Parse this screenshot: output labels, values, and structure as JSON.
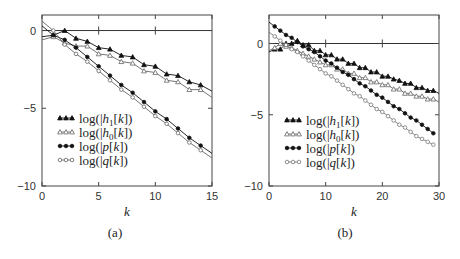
{
  "chart_data": [
    {
      "type": "line",
      "panel_label": "(a)",
      "title": "",
      "xlabel": "k",
      "ylabel": "",
      "xlim": [
        0,
        15
      ],
      "ylim": [
        -10,
        1
      ],
      "xticks": [
        0,
        5,
        10,
        15
      ],
      "yticks": [
        0,
        -5,
        -10
      ],
      "grid": false,
      "zero_line": true,
      "legend_position": "lower-left inside",
      "series": [
        {
          "name": "log(|h1[k])",
          "marker": "filled-triangle",
          "color": "#111111",
          "x": [
            0,
            1,
            2,
            3,
            4,
            5,
            6,
            7,
            8,
            9,
            10,
            11,
            12,
            13,
            14,
            15
          ],
          "y": [
            -0.4,
            -0.3,
            0.0,
            -0.5,
            -0.7,
            -1.1,
            -1.2,
            -1.6,
            -1.7,
            -2.2,
            -2.3,
            -2.8,
            -2.9,
            -3.3,
            -3.5,
            -3.9
          ]
        },
        {
          "name": "log(|h0[k])",
          "marker": "open-triangle",
          "color": "#666666",
          "x": [
            0,
            1,
            2,
            3,
            4,
            5,
            6,
            7,
            8,
            9,
            10,
            11,
            12,
            13,
            14,
            15
          ],
          "y": [
            -0.6,
            -0.4,
            -0.8,
            -1.0,
            -1.0,
            -1.5,
            -1.6,
            -2.0,
            -2.1,
            -2.6,
            -2.7,
            -3.2,
            -3.3,
            -3.8,
            -3.8,
            -4.3
          ]
        },
        {
          "name": "log(|p[k])",
          "marker": "filled-circle",
          "color": "#111111",
          "x": [
            0,
            1,
            2,
            3,
            4,
            5,
            6,
            7,
            8,
            9,
            10,
            11,
            12,
            13,
            14,
            15
          ],
          "y": [
            0.3,
            -0.3,
            -0.6,
            -1.1,
            -1.7,
            -2.3,
            -2.9,
            -3.5,
            -4.0,
            -4.6,
            -5.2,
            -5.7,
            -6.3,
            -6.9,
            -7.4,
            -7.9
          ]
        },
        {
          "name": "log(|q[k])",
          "marker": "open-circle",
          "color": "#666666",
          "x": [
            0,
            1,
            2,
            3,
            4,
            5,
            6,
            7,
            8,
            9,
            10,
            11,
            12,
            13,
            14,
            15
          ],
          "y": [
            0.6,
            0.0,
            -0.9,
            -1.5,
            -2.0,
            -2.6,
            -3.2,
            -3.8,
            -4.3,
            -4.9,
            -5.5,
            -6.0,
            -6.6,
            -7.2,
            -7.7,
            -8.2
          ]
        }
      ]
    },
    {
      "type": "line",
      "panel_label": "(b)",
      "title": "",
      "xlabel": "k",
      "ylabel": "",
      "xlim": [
        0,
        30
      ],
      "ylim": [
        -10,
        2
      ],
      "xticks": [
        0,
        10,
        20,
        30
      ],
      "yticks": [
        0,
        -5,
        -10
      ],
      "grid": false,
      "zero_line": true,
      "legend_position": "lower-left inside",
      "series": [
        {
          "name": "log(|h1[k])",
          "marker": "filled-triangle",
          "color": "#111111",
          "x": [
            0,
            1,
            2,
            3,
            4,
            5,
            6,
            7,
            8,
            9,
            10,
            11,
            12,
            13,
            14,
            15,
            16,
            17,
            18,
            19,
            20,
            21,
            22,
            23,
            24,
            25,
            26,
            27,
            28,
            29,
            30
          ],
          "y": [
            -0.6,
            -0.4,
            -0.4,
            0.0,
            0.0,
            0.2,
            -0.1,
            -0.1,
            -0.5,
            -0.5,
            -0.8,
            -0.8,
            -1.1,
            -1.1,
            -1.4,
            -1.4,
            -1.7,
            -1.7,
            -2.0,
            -2.0,
            -2.3,
            -2.3,
            -2.5,
            -2.6,
            -2.8,
            -2.8,
            -3.1,
            -3.1,
            -3.3,
            -3.3,
            -3.5
          ]
        },
        {
          "name": "log(|h0[k])",
          "marker": "open-triangle",
          "color": "#666666",
          "x": [
            0,
            1,
            2,
            3,
            4,
            5,
            6,
            7,
            8,
            9,
            10,
            11,
            12,
            13,
            14,
            15,
            16,
            17,
            18,
            19,
            20,
            21,
            22,
            23,
            24,
            25,
            26,
            27,
            28,
            29,
            30
          ],
          "y": [
            -0.5,
            -0.3,
            0.0,
            -0.2,
            -0.3,
            -0.5,
            -0.7,
            -0.9,
            -1.1,
            -1.3,
            -1.5,
            -1.5,
            -1.8,
            -1.8,
            -2.1,
            -2.1,
            -2.4,
            -2.4,
            -2.7,
            -2.7,
            -2.9,
            -2.9,
            -3.2,
            -3.2,
            -3.5,
            -3.5,
            -3.7,
            -3.7,
            -3.9,
            -3.9,
            -4.1
          ]
        },
        {
          "name": "log(|p[k])",
          "marker": "filled-circle",
          "color": "#111111",
          "x": [
            0,
            1,
            2,
            3,
            4,
            5,
            6,
            7,
            8,
            9,
            10,
            11,
            12,
            13,
            14,
            15,
            16,
            17,
            18,
            19,
            20,
            21,
            22,
            23,
            24,
            25,
            26,
            27,
            28,
            29
          ],
          "y": [
            1.5,
            1.2,
            0.9,
            0.6,
            0.4,
            0.1,
            -0.2,
            -0.4,
            -0.6,
            -0.9,
            -1.2,
            -1.4,
            -1.7,
            -2.0,
            -2.2,
            -2.5,
            -2.8,
            -3.0,
            -3.3,
            -3.6,
            -3.8,
            -4.1,
            -4.4,
            -4.6,
            -4.9,
            -5.2,
            -5.4,
            -5.7,
            -6.0,
            -6.3
          ]
        },
        {
          "name": "log(|q[k])",
          "marker": "open-circle",
          "color": "#777777",
          "x": [
            0,
            1,
            2,
            3,
            4,
            5,
            6,
            7,
            8,
            9,
            10,
            11,
            12,
            13,
            14,
            15,
            16,
            17,
            18,
            19,
            20,
            21,
            22,
            23,
            24,
            25,
            26,
            27,
            28,
            29
          ],
          "y": [
            0.8,
            0.5,
            0.2,
            -0.1,
            -0.4,
            -0.6,
            -0.9,
            -1.2,
            -1.5,
            -1.8,
            -2.1,
            -2.3,
            -2.6,
            -2.9,
            -3.2,
            -3.5,
            -3.7,
            -4.0,
            -4.3,
            -4.6,
            -4.8,
            -5.1,
            -5.4,
            -5.7,
            -5.9,
            -6.2,
            -6.5,
            -6.7,
            -6.9,
            -7.1
          ]
        }
      ]
    }
  ],
  "panels": {
    "a": {
      "caption": "(a)",
      "xlabel": "k"
    },
    "b": {
      "caption": "(b)",
      "xlabel": "k"
    }
  }
}
